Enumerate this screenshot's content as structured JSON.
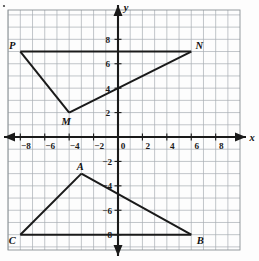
{
  "figure": {
    "kind": "coordinate-plane-graph",
    "background_color": "#fdfdfd",
    "grid_color": "#9aa0a6",
    "axis_color": "#1a1a1a",
    "shape_color": "#1a1a1a",
    "corner_mark": "•"
  },
  "axes": {
    "x_axis_label": "x",
    "y_axis_label": "y",
    "x_ticks": [
      "-8",
      "-6",
      "-4",
      "-2",
      "0",
      "2",
      "4",
      "6",
      "8"
    ],
    "y_ticks_positive": [
      "8",
      "6",
      "4",
      "2"
    ],
    "y_ticks_negative": [
      "-2",
      "-4",
      "-6",
      "-8"
    ],
    "x_range": [
      -9,
      10
    ],
    "y_range": [
      -9,
      10
    ],
    "tick_interval": 2,
    "grid_interval": 1,
    "origin_label": "0"
  },
  "chart_data": {
    "type": "scatter",
    "title": "",
    "xlabel": "x",
    "ylabel": "y",
    "xlim": [
      -9,
      10
    ],
    "ylim": [
      -9,
      10
    ],
    "grid": true,
    "legend": "none",
    "series": [
      {
        "name": "upper-figure-PMN",
        "points": [
          {
            "label": "P",
            "x": -8,
            "y": 7
          },
          {
            "label": "M",
            "x": -4,
            "y": 2
          },
          {
            "label": "N",
            "x": 6,
            "y": 7
          }
        ],
        "segments": [
          {
            "from": "P",
            "to": "N"
          },
          {
            "from": "P",
            "to": "M"
          },
          {
            "from": "M",
            "to": "N"
          }
        ]
      },
      {
        "name": "lower-figure-ACB",
        "points": [
          {
            "label": "A",
            "x": -3,
            "y": -3
          },
          {
            "label": "C",
            "x": -8,
            "y": -8
          },
          {
            "label": "B",
            "x": 6,
            "y": -8
          }
        ],
        "segments": [
          {
            "from": "C",
            "to": "B"
          },
          {
            "from": "C",
            "to": "A"
          },
          {
            "from": "A",
            "to": "B"
          }
        ]
      }
    ]
  },
  "point_labels": {
    "P": "P",
    "M": "M",
    "N": "N",
    "A": "A",
    "B": "B",
    "C": "C"
  }
}
